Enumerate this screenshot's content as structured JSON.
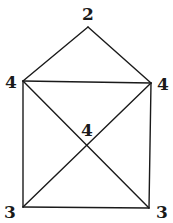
{
  "diagram": {
    "type": "graph",
    "vertices": [
      {
        "id": "top",
        "label": "2",
        "x": 88,
        "y": 27,
        "label_x": 88,
        "label_y": 14
      },
      {
        "id": "upper-left",
        "label": "4",
        "x": 23,
        "y": 81,
        "label_x": 11,
        "label_y": 82
      },
      {
        "id": "upper-right",
        "label": "4",
        "x": 151,
        "y": 83,
        "label_x": 163,
        "label_y": 84
      },
      {
        "id": "center",
        "label": "4",
        "x": 87,
        "y": 146,
        "label_x": 87,
        "label_y": 130
      },
      {
        "id": "lower-left",
        "label": "3",
        "x": 23,
        "y": 207,
        "label_x": 10,
        "label_y": 212
      },
      {
        "id": "lower-right",
        "label": "3",
        "x": 149,
        "y": 208,
        "label_x": 162,
        "label_y": 212
      }
    ],
    "edges": [
      [
        "top",
        "upper-left"
      ],
      [
        "top",
        "upper-right"
      ],
      [
        "upper-left",
        "upper-right"
      ],
      [
        "upper-left",
        "lower-left"
      ],
      [
        "upper-right",
        "lower-right"
      ],
      [
        "lower-left",
        "lower-right"
      ],
      [
        "upper-left",
        "center"
      ],
      [
        "center",
        "lower-right"
      ],
      [
        "upper-right",
        "center"
      ],
      [
        "center",
        "lower-left"
      ]
    ],
    "labels": {
      "top": "2",
      "upper_left": "4",
      "upper_right": "4",
      "center": "4",
      "lower_left": "3",
      "lower_right": "3"
    },
    "colors": {
      "stroke": "#1a1a1a",
      "background": "#ffffff"
    }
  }
}
